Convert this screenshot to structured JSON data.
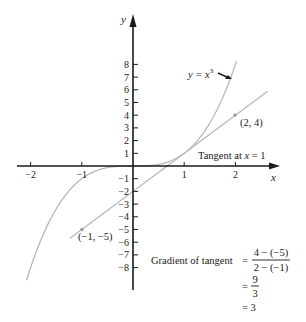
{
  "chart_data": {
    "type": "line",
    "title": "",
    "xlabel": "x",
    "ylabel": "y",
    "xlim": [
      -2.3,
      2.85
    ],
    "ylim": [
      -9.7,
      11.7
    ],
    "grid": false,
    "x_ticks": [
      -2,
      -1,
      1,
      2
    ],
    "x_tick_labels": [
      "−2",
      "−1",
      "1",
      "2"
    ],
    "y_ticks": [
      8,
      7,
      6,
      5,
      4,
      3,
      2,
      1,
      -1,
      -2,
      -3,
      -4,
      -5,
      -6,
      -7,
      -8
    ],
    "y_tick_labels": [
      "8",
      "7",
      "6",
      "5",
      "4",
      "3",
      "2",
      "1",
      "−1",
      "−2",
      "−3",
      "−4",
      "−5",
      "−6",
      "−7",
      "−8"
    ],
    "series": [
      {
        "name": "y = x³",
        "function": "x^3",
        "x_range": [
          -2.08,
          2.02
        ],
        "x": [
          -2,
          -1.5,
          -1,
          -0.5,
          0,
          0.5,
          1,
          1.5,
          2
        ],
        "y": [
          -8,
          -3.375,
          -1,
          -0.125,
          0,
          0.125,
          1,
          3.375,
          8
        ],
        "color": "#b5b5b5"
      },
      {
        "name": "Tangent at x = 1",
        "function": "3x - 2",
        "x_range": [
          -1.23,
          2.63
        ],
        "x": [
          -1,
          0,
          1,
          2
        ],
        "y": [
          -5,
          -2,
          1,
          4
        ],
        "color": "#b5b5b5"
      }
    ],
    "points": [
      {
        "x": 2,
        "y": 4,
        "label": "(2, 4)"
      },
      {
        "x": -1,
        "y": -5,
        "label": "(−1, −5)"
      }
    ],
    "annotations": [
      {
        "text": "y = x³",
        "target": "curve"
      },
      {
        "text": "Tangent at x = 1",
        "target": "tangent line"
      },
      {
        "text": "Gradient of tangent = (4 − (−5)) / (2 − (−1)) = 9/3 = 3"
      }
    ]
  },
  "labels": {
    "x_axis": "x",
    "y_axis": "y",
    "curve_label": "y = x",
    "curve_exp": "3",
    "tangent_label_pre": "Tangent at ",
    "tangent_label_var": "x",
    "tangent_label_post": " = 1",
    "point_a": "(2, 4)",
    "point_b": "(−1, −5)",
    "gradient_label": "Gradient of tangent",
    "eq1": "=",
    "frac1_num": "4 − (−5)",
    "frac1_den": "2 − (−1)",
    "eq2": "=",
    "frac2_num": "9",
    "frac2_den": "3",
    "eq3": "= 3"
  }
}
